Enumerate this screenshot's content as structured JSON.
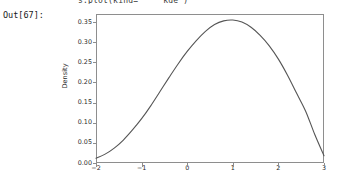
{
  "notebook": {
    "code_echo": "s.plot(kind=    'kde')",
    "out_prompt": "Out[67]:"
  },
  "chart_data": {
    "type": "line",
    "title": "",
    "subtitle": "",
    "xlabel": "",
    "ylabel": "Density",
    "legend": [],
    "legend_position": "none",
    "grid": false,
    "xlim": [
      -2,
      3
    ],
    "ylim": [
      0.0,
      0.37
    ],
    "xticks": [
      -2,
      -1,
      0,
      1,
      2,
      3
    ],
    "xtick_labels": [
      "−2",
      "−1",
      "0",
      "1",
      "2",
      "3"
    ],
    "yticks": [
      0.0,
      0.05,
      0.1,
      0.15,
      0.2,
      0.25,
      0.3,
      0.35
    ],
    "ytick_labels": [
      "0.00",
      "0.05",
      "0.10",
      "0.15",
      "0.20",
      "0.25",
      "0.30",
      "0.35"
    ],
    "line_color": "#555555",
    "line_width": 1.1,
    "series": [
      {
        "name": "Density",
        "x": [
          -2.0,
          -1.8,
          -1.6,
          -1.4,
          -1.2,
          -1.0,
          -0.8,
          -0.6,
          -0.4,
          -0.2,
          0.0,
          0.2,
          0.4,
          0.6,
          0.8,
          1.0,
          1.2,
          1.4,
          1.6,
          1.8,
          2.0,
          2.2,
          2.4,
          2.6,
          2.8,
          3.0
        ],
        "values": [
          0.012,
          0.022,
          0.037,
          0.057,
          0.082,
          0.11,
          0.142,
          0.177,
          0.212,
          0.246,
          0.277,
          0.304,
          0.327,
          0.344,
          0.353,
          0.355,
          0.35,
          0.337,
          0.317,
          0.291,
          0.258,
          0.218,
          0.173,
          0.128,
          0.07,
          0.018
        ]
      }
    ],
    "peak": {
      "x": 0.9,
      "y": 0.355
    }
  }
}
